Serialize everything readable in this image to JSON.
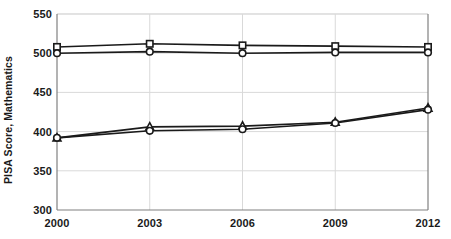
{
  "chart_data": {
    "type": "line",
    "title": "",
    "xlabel": "",
    "ylabel": "PISA Score, Mathematics",
    "categories": [
      "2000",
      "2003",
      "2006",
      "2009",
      "2012"
    ],
    "x": [
      2000,
      2003,
      2006,
      2009,
      2012
    ],
    "ylim": [
      300,
      550
    ],
    "yticks": [
      300,
      350,
      400,
      450,
      500,
      550
    ],
    "ytick_labels": [
      "300",
      "350",
      "400",
      "450",
      "500",
      "550"
    ],
    "xtick_labels": [
      "2000",
      "2003",
      "2006",
      "2009",
      "2012"
    ],
    "grid": true,
    "legend": "none",
    "series": [
      {
        "name": "series-squares-upper",
        "marker": "square",
        "color": "#1a1a1a",
        "values": [
          508,
          512,
          510,
          509,
          508
        ]
      },
      {
        "name": "series-circles-upper",
        "marker": "circle",
        "color": "#1a1a1a",
        "values": [
          500,
          502,
          500,
          501,
          501
        ]
      },
      {
        "name": "series-triangles-lower",
        "marker": "triangle",
        "color": "#1a1a1a",
        "values": [
          392,
          406,
          407,
          412,
          430
        ]
      },
      {
        "name": "series-circles-lower",
        "marker": "circle",
        "color": "#1a1a1a",
        "values": [
          392,
          401,
          403,
          411,
          428
        ]
      }
    ],
    "colors": {
      "line": "#1a1a1a",
      "marker_fill": "#ffffff",
      "grid": "#d9d9d9",
      "axis": "#808080",
      "text": "#1a1a1a",
      "background": "#ffffff"
    },
    "plot_area": {
      "left": 57,
      "right": 428,
      "top": 14,
      "bottom": 210
    }
  }
}
